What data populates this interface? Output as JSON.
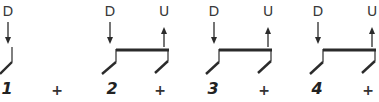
{
  "diagram": {
    "type": "strumming-pattern",
    "colors": {
      "stroke": "#2b2b2b",
      "text": "#3a3a3a"
    },
    "strums": [
      {
        "beat": "1",
        "direction": "D",
        "x": 8
      },
      {
        "beat": "2",
        "direction": "D",
        "x": 110
      },
      {
        "beat": "2+",
        "direction": "U",
        "x": 164
      },
      {
        "beat": "3",
        "direction": "D",
        "x": 214
      },
      {
        "beat": "3+",
        "direction": "U",
        "x": 268
      },
      {
        "beat": "4",
        "direction": "D",
        "x": 318
      },
      {
        "beat": "4+",
        "direction": "U",
        "x": 372
      }
    ],
    "counts": [
      {
        "label": "1",
        "x": 7
      },
      {
        "label": "+",
        "x": 57
      },
      {
        "label": "2",
        "x": 112
      },
      {
        "label": "+",
        "x": 160
      },
      {
        "label": "3",
        "x": 213
      },
      {
        "label": "+",
        "x": 264
      },
      {
        "label": "4",
        "x": 317
      },
      {
        "label": "+",
        "x": 368
      }
    ]
  }
}
